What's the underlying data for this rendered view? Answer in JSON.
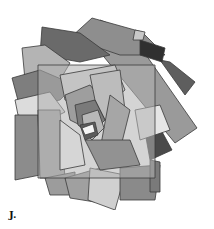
{
  "figure": {
    "label": "J.",
    "background": "#ffffff",
    "center": [
      95,
      128
    ],
    "rectangles": [
      {
        "points": "100,20 130,32 197,128 175,143 90,40",
        "fill": "#9a9a9a"
      },
      {
        "points": "92,18 142,32 165,55 120,55 70,38",
        "fill": "#8e8e8e"
      },
      {
        "points": "42,27 80,33 110,55 80,62 40,55",
        "fill": "#6a6a6a"
      },
      {
        "points": "22,48 45,45 70,63 60,80 25,80",
        "fill": "#b4b4b4"
      },
      {
        "points": "12,78 40,70 75,85 60,100 20,108",
        "fill": "#7e7e7e"
      },
      {
        "points": "15,100 50,92 65,112 45,122 18,115",
        "fill": "#dcdcdc"
      },
      {
        "points": "15,115 38,115 40,175 15,180",
        "fill": "#8c8c8c"
      },
      {
        "points": "38,110 60,110 65,178 40,178",
        "fill": "#a8a8a8"
      },
      {
        "points": "45,178 75,172 75,195 50,195",
        "fill": "#9c9c9c"
      },
      {
        "points": "65,178 100,168 95,202 70,198",
        "fill": "#a0a0a0"
      },
      {
        "points": "90,168 125,175 115,210 88,200",
        "fill": "#d0d0d0"
      },
      {
        "points": "120,168 160,165 155,200 120,200",
        "fill": "#8a8a8a"
      },
      {
        "points": "150,160 160,162 160,192 150,192",
        "fill": "#7a7a7a"
      },
      {
        "points": "145,132 160,128 172,150 150,160",
        "fill": "#4a4a4a"
      },
      {
        "points": "135,110 160,105 170,130 140,140",
        "fill": "#e6e6e6"
      },
      {
        "points": "160,60 170,62 195,82 185,95",
        "fill": "#5e5e5e"
      },
      {
        "points": "140,40 165,48 162,62 140,55",
        "fill": "#303030"
      },
      {
        "points": "135,30 145,32 143,40 133,40",
        "fill": "#c8c8c8"
      },
      {
        "points": "38,65 155,65 155,178 38,178",
        "fill": "#b0b0b0",
        "opacity": 0.55
      },
      {
        "points": "60,75 115,65 125,90 100,110 65,100",
        "fill": "#c4c4c4"
      },
      {
        "points": "65,95 90,85 110,110 90,130 70,120",
        "fill": "#9e9e9e"
      },
      {
        "points": "90,75 120,70 125,110 105,120 95,100",
        "fill": "#bcbcbc"
      },
      {
        "points": "110,95 130,110 120,150 100,150",
        "fill": "#a6a6a6"
      },
      {
        "points": "85,140 130,140 140,165 100,170",
        "fill": "#929292"
      },
      {
        "points": "60,120 80,135 85,165 60,170",
        "fill": "#d6d6d6"
      },
      {
        "points": "75,105 95,100 105,120 90,135 78,125",
        "fill": "#7a7a7a"
      },
      {
        "points": "82,115 98,110 104,128 92,140 84,132",
        "fill": "#b8b8b8"
      },
      {
        "points": "80,125 95,122 98,135 85,140",
        "fill": "#5c5c5c"
      },
      {
        "points": "82,128 93,124 95,132 85,135",
        "fill": "#f4f4f4"
      }
    ]
  }
}
